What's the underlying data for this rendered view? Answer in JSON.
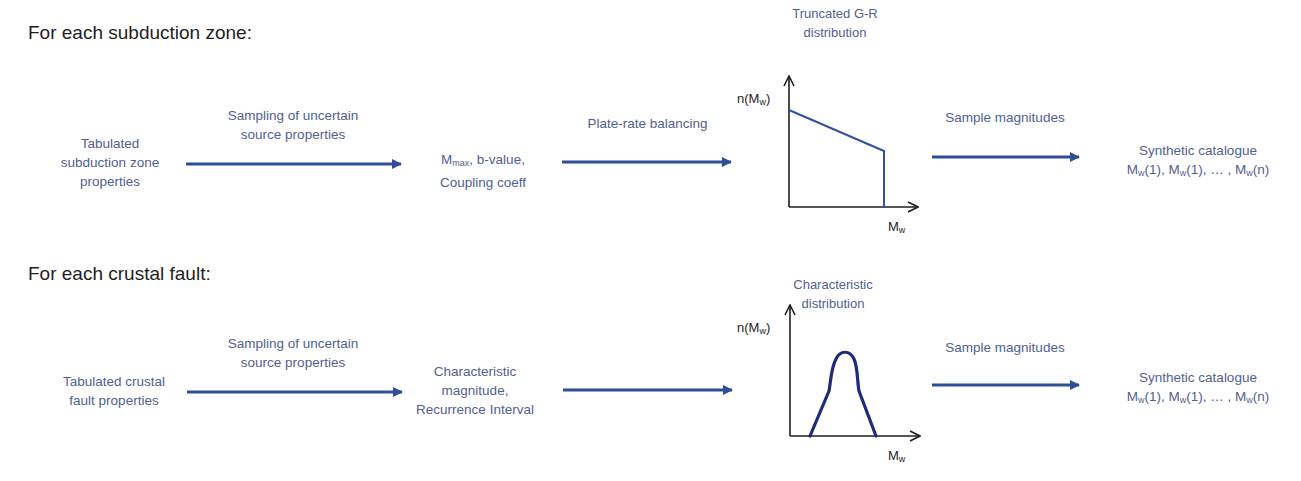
{
  "colors": {
    "arrow": "#2f4e96",
    "text_blue": "#51618f",
    "heading": "#1e1e1e",
    "gr_line": "#3450a0",
    "char_curve": "#1f2a78",
    "axis": "#1e1e1e"
  },
  "rows": [
    {
      "heading": "For each subduction zone:",
      "input": [
        "Tabulated",
        "subduction zone",
        "properties"
      ],
      "step1_label": [
        "Sampling of uncertain",
        "source properties"
      ],
      "params": {
        "line1_prefix": "M",
        "line1_sub": "max",
        "line1_suffix": ", b-value,",
        "line2": "Coupling coeff"
      },
      "step2_label": "Plate-rate balancing",
      "distribution_title": [
        "Truncated G-R",
        "distribution"
      ],
      "y_axis_label": {
        "prefix": "n(M",
        "sub": "w",
        "suffix": ")"
      },
      "x_axis_label": {
        "prefix": "M",
        "sub": "w"
      },
      "step3_label": "Sample magnitudes",
      "output_title": "Synthetic catalogue",
      "output_series": {
        "m": "M",
        "w": "w",
        "a": "(1), ",
        "b": "(1), … , ",
        "c": "(n)"
      }
    },
    {
      "heading": "For each crustal fault:",
      "input": [
        "Tabulated crustal",
        "fault properties"
      ],
      "step1_label": [
        "Sampling of uncertain",
        "source properties"
      ],
      "params": [
        "Characteristic",
        "magnitude,",
        "Recurrence Interval"
      ],
      "distribution_title": [
        "Characteristic",
        "distribution"
      ],
      "y_axis_label": {
        "prefix": "n(M",
        "sub": "w",
        "suffix": ")"
      },
      "x_axis_label": {
        "prefix": "M",
        "sub": "w"
      },
      "step3_label": "Sample magnitudes",
      "output_title": "Synthetic catalogue",
      "output_series": {
        "m": "M",
        "w": "w",
        "a": "(1), ",
        "b": "(1), … , ",
        "c": "(n)"
      }
    }
  ]
}
